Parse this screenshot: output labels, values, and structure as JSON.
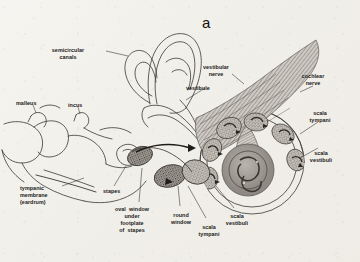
{
  "figure": {
    "panel_label": "a",
    "background_color": "#f2efe9",
    "ink_color": "#2b2b2b"
  },
  "labels": [
    {
      "id": "semicircular-canals",
      "text": "semicircular\ncanals",
      "align": "center",
      "x": 68,
      "y": 47
    },
    {
      "id": "vestibule",
      "text": "vestibule",
      "align": "left",
      "x": 186,
      "y": 85
    },
    {
      "id": "vestibular-nerve",
      "text": "vestibular\nnerve",
      "align": "center",
      "x": 216,
      "y": 64
    },
    {
      "id": "cochlear-nerve",
      "text": "cochlear\nnerve",
      "align": "center",
      "x": 313,
      "y": 73
    },
    {
      "id": "scala-tympani-right",
      "text": "scala\ntympani",
      "align": "center",
      "x": 320,
      "y": 110
    },
    {
      "id": "scala-vestibuli-right",
      "text": "scala\nvestibuli",
      "align": "center",
      "x": 320,
      "y": 150
    },
    {
      "id": "malleus",
      "text": "malleus",
      "align": "left",
      "x": 16,
      "y": 100
    },
    {
      "id": "incus",
      "text": "incus",
      "align": "left",
      "x": 68,
      "y": 102
    },
    {
      "id": "tympanic-membrane",
      "text": "tympanic\nmembrane\n(eardrum)",
      "align": "left",
      "x": 20,
      "y": 185
    },
    {
      "id": "stapes",
      "text": "stapes",
      "align": "left",
      "x": 103,
      "y": 188
    },
    {
      "id": "oval-window",
      "text": "oval  window\nunder\nfootplate\nof  stapes",
      "align": "center",
      "x": 131,
      "y": 206
    },
    {
      "id": "round-window",
      "text": "round\nwindow",
      "align": "center",
      "x": 180,
      "y": 212
    },
    {
      "id": "scala-tympani-bottom",
      "text": "scala\ntympani",
      "align": "center",
      "x": 208,
      "y": 224
    },
    {
      "id": "scala-vestibuli-bottom",
      "text": "scala\nvestibuli",
      "align": "center",
      "x": 236,
      "y": 213
    }
  ],
  "structures": [
    {
      "id": "semicircular-canals",
      "kind": "line-art-loops"
    },
    {
      "id": "vestibule",
      "kind": "line-art-chamber"
    },
    {
      "id": "malleus",
      "kind": "ossicle-outline"
    },
    {
      "id": "incus",
      "kind": "ossicle-outline"
    },
    {
      "id": "stapes",
      "kind": "ossicle-outline"
    },
    {
      "id": "tympanic-membrane",
      "kind": "membrane-line"
    },
    {
      "id": "cochlea",
      "kind": "stippled-spiral"
    },
    {
      "id": "nerve-bundle",
      "kind": "striated-fibers"
    },
    {
      "id": "oval-window",
      "kind": "stippled-oval"
    },
    {
      "id": "round-window",
      "kind": "stippled-oval"
    }
  ]
}
